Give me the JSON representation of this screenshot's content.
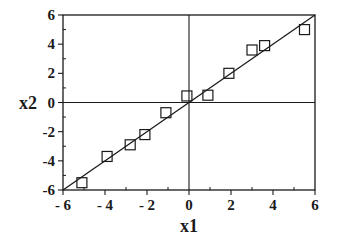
{
  "chart_data": {
    "type": "scatter",
    "title": "",
    "xlabel": "x1",
    "ylabel": "x2",
    "xlim": [
      -6,
      6
    ],
    "ylim": [
      -6,
      6
    ],
    "grid": false,
    "legend": null,
    "x_ticks": [
      -6,
      -4,
      -2,
      0,
      2,
      4,
      6
    ],
    "y_ticks": [
      -6,
      -4,
      -2,
      0,
      2,
      4,
      6
    ],
    "x_tick_labels": [
      "- 6",
      "- 4",
      "- 2",
      "0",
      "2",
      "4",
      "6"
    ],
    "y_tick_labels": [
      "-6",
      "-4",
      "-2",
      "0",
      "2",
      "4",
      "6"
    ],
    "zero_lines": true,
    "marker": "open-square",
    "series": [
      {
        "name": "observations",
        "type": "scatter",
        "points": [
          {
            "x": -5.1,
            "y": -5.5
          },
          {
            "x": -3.9,
            "y": -3.7
          },
          {
            "x": -2.8,
            "y": -2.9
          },
          {
            "x": -2.1,
            "y": -2.2
          },
          {
            "x": -1.1,
            "y": -0.7
          },
          {
            "x": -0.1,
            "y": 0.45
          },
          {
            "x": 0.9,
            "y": 0.5
          },
          {
            "x": 1.9,
            "y": 2.0
          },
          {
            "x": 3.0,
            "y": 3.6
          },
          {
            "x": 3.6,
            "y": 3.9
          },
          {
            "x": 5.5,
            "y": 5.0
          }
        ]
      },
      {
        "name": "fit line",
        "type": "line",
        "points": [
          {
            "x": -6,
            "y": -6
          },
          {
            "x": 6,
            "y": 6
          }
        ]
      }
    ],
    "colors": {
      "ink": "#1a1a1a",
      "background": "#ffffff"
    }
  }
}
